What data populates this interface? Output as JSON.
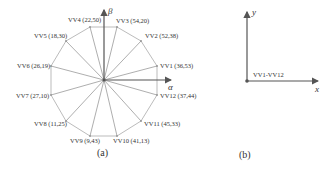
{
  "panel_a": {
    "caption": "(a)",
    "axis_alpha": "α",
    "axis_beta": "β",
    "vectors": [
      {
        "label": "VV1 (36,53)"
      },
      {
        "label": "VV2 (52,38)"
      },
      {
        "label": "VV3 (54,20)"
      },
      {
        "label": "VV4 (22,50)"
      },
      {
        "label": "VV5 (18,30)"
      },
      {
        "label": "VV6 (26,19)"
      },
      {
        "label": "VV7 (27,10)"
      },
      {
        "label": "VV8 (11,25)"
      },
      {
        "label": "VV9 (9,43)"
      },
      {
        "label": "VV10 (41,13)"
      },
      {
        "label": "VV11 (45,33)"
      },
      {
        "label": "VV12 (37,44)"
      }
    ]
  },
  "panel_b": {
    "caption": "(b)",
    "axis_x": "x",
    "axis_y": "y",
    "origin_label": "VV1-VV12"
  },
  "colors": {
    "line": "#9a9a9a",
    "axis": "#555555",
    "text": "#333333"
  }
}
